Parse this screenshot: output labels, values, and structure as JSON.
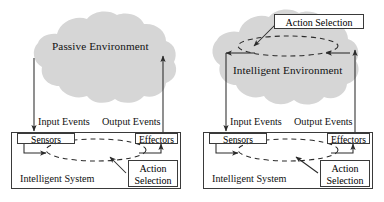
{
  "figure": {
    "type": "diagram",
    "background_color": "#ffffff",
    "cloud_fill": "#d6d6d6",
    "stroke_color": "#2b2b2b"
  },
  "panels": [
    {
      "id": "passive",
      "cloud_label": "Passive Environment",
      "system_label": "Intelligent System",
      "input_label": "Input Events",
      "output_label": "Output Events",
      "sensors_label": "Sensors",
      "effectors_label": "Effectors",
      "action_selection": {
        "line1": "Action",
        "line2": "Selection"
      }
    },
    {
      "id": "intelligent",
      "cloud_label": "Intelligent  Environment",
      "system_label": "Intelligent System",
      "input_label": "Input Events",
      "output_label": "Output Events",
      "sensors_label": "Sensors",
      "effectors_label": "Effectors",
      "action_selection_cloud": "Action Selection",
      "action_selection": {
        "line1": "Action",
        "line2": "Selection"
      }
    }
  ]
}
